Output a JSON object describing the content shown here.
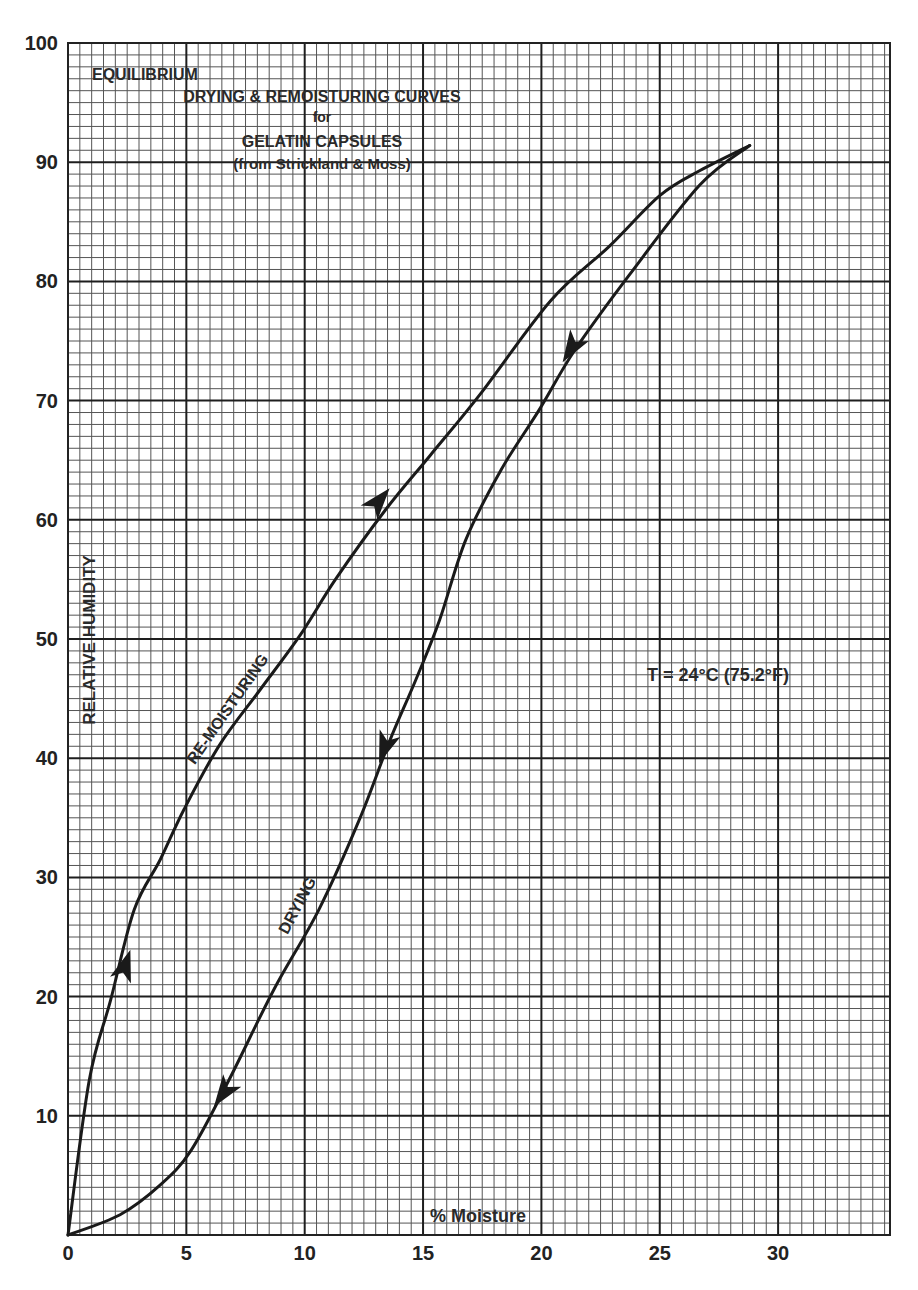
{
  "chart_data": {
    "type": "line",
    "title_lines": [
      "EQUILIBRIUM",
      "DRYING & REMOISTURING CURVES",
      "for",
      "GELATIN CAPSULES",
      "(from Strickland & Moss)"
    ],
    "xlabel": "% Moisture",
    "ylabel": "RELATIVE HUMIDITY",
    "xlim": [
      0,
      35
    ],
    "ylim": [
      0,
      100
    ],
    "x_ticks": [
      0,
      5,
      10,
      15,
      20,
      25,
      30
    ],
    "y_ticks": [
      10,
      20,
      30,
      40,
      50,
      60,
      70,
      80,
      90,
      100
    ],
    "grid": true,
    "annotations": [
      {
        "text": "T = 24°C (75.2°F)",
        "x": 23,
        "y": 47
      },
      {
        "text": "RE-MOISTURING",
        "curve": "re-moisturing"
      },
      {
        "text": "DRYING",
        "curve": "drying"
      }
    ],
    "series": [
      {
        "name": "RE-MOISTURING",
        "direction": "increasing humidity (arrows point up)",
        "x": [
          0,
          0.9,
          1.8,
          2.8,
          3.9,
          4.9,
          6.4,
          8.1,
          9.8,
          11.3,
          13.4,
          15.3,
          17.4,
          20.4,
          22.9,
          25.0,
          26.7,
          28.8
        ],
        "y": [
          0,
          13,
          19.7,
          27.3,
          31.5,
          35.7,
          41.1,
          45.7,
          50.3,
          55.0,
          60.8,
          65.4,
          70.5,
          78.4,
          83.0,
          87.2,
          89.3,
          91.4
        ]
      },
      {
        "name": "DRYING",
        "direction": "decreasing humidity (arrows point down)",
        "x": [
          28.8,
          26.7,
          23.7,
          21.4,
          19.9,
          18.3,
          16.8,
          15.7,
          14.7,
          13.6,
          12.3,
          10.6,
          8.7,
          6.8,
          5.2,
          3.9,
          2.2,
          0
        ],
        "y": [
          91.4,
          88.1,
          80.5,
          74.2,
          69.2,
          64.2,
          58.3,
          51.6,
          46.6,
          41.5,
          34.8,
          27.3,
          20.6,
          13.0,
          7.1,
          4.2,
          1.7,
          0
        ]
      }
    ]
  },
  "labels": {
    "temperature": "T = 24°C (75.2°F)",
    "remoisturing": "RE-MOISTURING",
    "drying": "DRYING",
    "xlabel": "% Moisture",
    "ylabel": "RELATIVE HUMIDITY"
  }
}
